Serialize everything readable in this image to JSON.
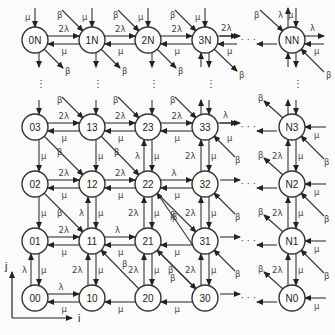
{
  "diagram": {
    "type": "state-transition lattice",
    "axes": {
      "x_label": "i",
      "y_label": "j"
    },
    "columns": [
      "0",
      "1",
      "2",
      "3",
      "N"
    ],
    "rows": [
      "N",
      "3",
      "2",
      "1",
      "0"
    ],
    "nodes": [
      {
        "id": "0N",
        "label": "0N"
      },
      {
        "id": "1N",
        "label": "1N"
      },
      {
        "id": "2N",
        "label": "2N"
      },
      {
        "id": "3N",
        "label": "3N"
      },
      {
        "id": "NN",
        "label": "NN"
      },
      {
        "id": "03",
        "label": "03"
      },
      {
        "id": "13",
        "label": "13"
      },
      {
        "id": "23",
        "label": "23"
      },
      {
        "id": "33",
        "label": "33"
      },
      {
        "id": "N3",
        "label": "N3"
      },
      {
        "id": "02",
        "label": "02"
      },
      {
        "id": "12",
        "label": "12"
      },
      {
        "id": "22",
        "label": "22"
      },
      {
        "id": "32",
        "label": "32"
      },
      {
        "id": "N2",
        "label": "N2"
      },
      {
        "id": "01",
        "label": "01"
      },
      {
        "id": "11",
        "label": "11"
      },
      {
        "id": "21",
        "label": "21"
      },
      {
        "id": "31",
        "label": "31"
      },
      {
        "id": "N1",
        "label": "N1"
      },
      {
        "id": "00",
        "label": "00"
      },
      {
        "id": "10",
        "label": "10"
      },
      {
        "id": "20",
        "label": "20"
      },
      {
        "id": "30",
        "label": "30"
      },
      {
        "id": "N0",
        "label": "N0"
      }
    ],
    "rate_symbols": {
      "lambda": "λ",
      "two_lambda": "2λ",
      "mu": "μ",
      "beta": "β"
    },
    "ellipsis": "· · ·",
    "vertical_ellipsis": "⋮"
  }
}
